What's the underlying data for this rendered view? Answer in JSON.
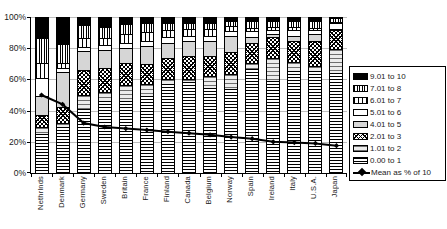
{
  "chart_data": {
    "type": "bar",
    "subtype": "stacked-percentage-bars-with-line-overlay",
    "title": "",
    "xlabel": "",
    "ylabel": "",
    "ylim": [
      0,
      100
    ],
    "grid": "horizontal",
    "legend_position": "right",
    "categories": [
      "Nethrlnds",
      "Denmark",
      "Germany",
      "Sweden",
      "Britain",
      "France",
      "Finland",
      "Canada",
      "Belgium",
      "Norway",
      "Spain",
      "Ireland",
      "Italy",
      "U.S.A.",
      "Japan"
    ],
    "y_ticks": {
      "values": [
        0,
        20,
        40,
        60,
        80,
        100
      ],
      "labels": [
        "0%",
        "20%",
        "40%",
        "60%",
        "80%",
        "100%"
      ]
    },
    "series": [
      {
        "name": "0.00 to 1",
        "pattern": "h-dense",
        "values": [
          25,
          29.5,
          41,
          46.5,
          46.5,
          50,
          57.5,
          58.5,
          55,
          54,
          67,
          59.5,
          66,
          66,
          64.5
        ]
      },
      {
        "name": "1.01 to 2",
        "pattern": "h-sparse",
        "values": [
          4.5,
          3,
          9.5,
          5.5,
          10.5,
          7.5,
          3,
          2,
          7.5,
          10,
          4,
          15,
          5.5,
          3,
          15.5
        ]
      },
      {
        "name": "2.01 to 3",
        "pattern": "crosshatch",
        "values": [
          8,
          10,
          16,
          16,
          14,
          13,
          14,
          15,
          13,
          14,
          13,
          13,
          14,
          16,
          12
        ]
      },
      {
        "name": "4.01 to 5",
        "pattern": "gray",
        "values": [
          12,
          22.5,
          12,
          11.5,
          9.5,
          11.5,
          9.5,
          9.5,
          9.5,
          10.5,
          4,
          2,
          3,
          4.5,
          1
        ]
      },
      {
        "name": "5.01 to 6",
        "pattern": "white",
        "values": [
          12,
          3,
          3,
          3,
          3.5,
          3.5,
          3.5,
          3.5,
          3.5,
          3,
          3.5,
          2.5,
          3.5,
          3,
          3.5
        ]
      },
      {
        "name": "6.01 to 7",
        "pattern": "v-sparse",
        "values": [
          9.5,
          3,
          5.5,
          4.5,
          5.5,
          5.5,
          4.5,
          4.5,
          4.5,
          3.5,
          2,
          2,
          2,
          1,
          0.5
        ]
      },
      {
        "name": "7.01 to 8",
        "pattern": "v-dense",
        "values": [
          16,
          12,
          8.5,
          7.5,
          6.5,
          6,
          5,
          4,
          4,
          3,
          4.5,
          4,
          4,
          4.5,
          3
        ]
      },
      {
        "name": "9.01 to 10",
        "pattern": "solid-black",
        "values": [
          13,
          17,
          4.5,
          5.5,
          4,
          3,
          3,
          3,
          3,
          2,
          2,
          2,
          2,
          2,
          0
        ]
      }
    ],
    "line_series": {
      "name": "Mean as % of 10",
      "values": [
        50,
        44,
        32,
        29.5,
        28.5,
        27.5,
        26.5,
        25.5,
        24.5,
        23,
        22,
        20,
        19.5,
        19,
        17.5
      ],
      "color": "#000000",
      "marker": "diamond"
    },
    "legend": [
      {
        "label": "9.01 to 10",
        "pattern": "solid-black"
      },
      {
        "label": "7.01 to 8",
        "pattern": "v-dense"
      },
      {
        "label": "6.01 to 7",
        "pattern": "v-sparse"
      },
      {
        "label": "5.01 to 6",
        "pattern": "white"
      },
      {
        "label": "4.01 to 5",
        "pattern": "gray"
      },
      {
        "label": "2.01 to 3",
        "pattern": "crosshatch"
      },
      {
        "label": "1.01 to 2",
        "pattern": "h-sparse"
      },
      {
        "label": "0.00 to 1",
        "pattern": "h-dense"
      },
      {
        "label": "Mean as % of 10",
        "pattern": "line-marker"
      }
    ],
    "colors": {
      "bar_outline": "#000000",
      "gridline": "#bdbdbd",
      "gray_fill": "#d6d6d6",
      "black_fill": "#000000",
      "background": "#ffffff"
    }
  }
}
